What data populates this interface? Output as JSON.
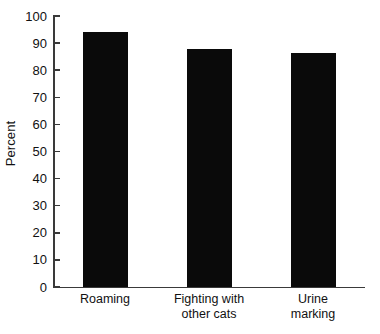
{
  "chart_data": {
    "type": "bar",
    "title": "",
    "xlabel": "",
    "ylabel": "Percent",
    "ylim": [
      0,
      100
    ],
    "yticks": [
      0,
      10,
      20,
      30,
      40,
      50,
      60,
      70,
      80,
      90,
      100
    ],
    "ytick_labels": [
      "0",
      "10",
      "20",
      "30",
      "40",
      "50",
      "60",
      "70",
      "80",
      "90",
      "100"
    ],
    "grid": false,
    "legend": null,
    "bar_color": "#0a0a0a",
    "axis_color": "#3a3a3a",
    "categories": [
      "Roaming",
      "Fighting with\nother cats",
      "Urine\nmarking"
    ],
    "values": [
      94,
      88,
      86.5
    ],
    "series": [
      {
        "name": "Percent",
        "values": [
          94,
          88,
          86.5
        ]
      }
    ]
  }
}
